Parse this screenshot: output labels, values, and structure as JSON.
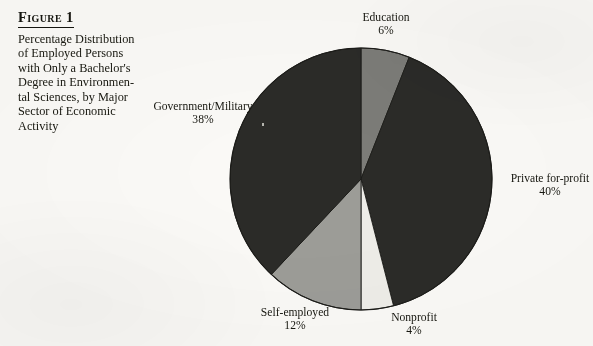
{
  "figure": {
    "title": "Figure 1",
    "caption_lines": [
      "Percentage Distribution",
      "of Employed Persons",
      "with Only a Bachelor's",
      "Degree in Environmen-",
      "tal Sciences, by Major",
      "Sector of Economic",
      "Activity"
    ],
    "caption_full": "Percentage Distribution of Employed Persons with Only a Bachelor's Degree in Environmental Sciences, by Major Sector of Economic Activity"
  },
  "labels": {
    "education": {
      "name": "Education",
      "pct": "6%"
    },
    "private": {
      "name": "Private for-profit",
      "pct": "40%"
    },
    "nonprofit": {
      "name": "Nonprofit",
      "pct": "4%"
    },
    "self_employed": {
      "name": "Self-employed",
      "pct": "12%"
    },
    "government": {
      "name": "Government/Military",
      "pct": "38%"
    }
  },
  "chart_data": {
    "type": "pie",
    "categories": [
      "Education",
      "Private for-profit",
      "Nonprofit",
      "Self-employed",
      "Government/Military"
    ],
    "values": [
      6,
      40,
      4,
      12,
      38
    ],
    "value_labels": [
      "6%",
      "40%",
      "4%",
      "12%",
      "38%"
    ],
    "units": "percent",
    "total": 100,
    "start_angle_deg": 0,
    "direction": "clockwise",
    "colors": [
      "#7c7c78",
      "#2b2b28",
      "#efeee9",
      "#9d9d98",
      "#2b2b28"
    ],
    "slice_colors": {
      "Education": "#7c7c78",
      "Private for-profit": "#2b2b28",
      "Nonprofit": "#efeee9",
      "Self-employed": "#9d9d98",
      "Government/Military": "#2b2b28"
    },
    "legend": "none",
    "labels_position": "outside",
    "grid": false,
    "center_px": [
      361,
      179
    ],
    "radius_px": 131
  },
  "colors": {
    "page_background": "#fbfaf7",
    "ink": "#16160f",
    "slice_dark": "#2b2b28",
    "slice_mid_gray": "#7c7c78",
    "slice_light_gray": "#9d9d98",
    "slice_white": "#efeee9",
    "slice_outline": "#1c1c19"
  }
}
